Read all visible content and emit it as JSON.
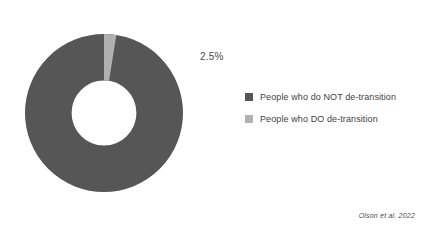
{
  "chart_data": {
    "type": "pie",
    "variant": "donut",
    "title": "",
    "xlabel": "",
    "ylabel": "",
    "grid": false,
    "legend_position": "right",
    "hole_ratio": 0.41,
    "start_angle_deg": 0,
    "direction": "clockwise",
    "units": "percent",
    "categories": [
      "People who do NOT de-transition",
      "People who DO de-transition"
    ],
    "values": [
      97.5,
      2.5
    ],
    "data_labels": [
      "97.5%",
      "2.5%"
    ],
    "colors": [
      "#565656",
      "#b0b0b0"
    ],
    "slices": [
      {
        "name": "People who do NOT de-transition",
        "value": 97.5,
        "label": "97.5%",
        "color": "#565656",
        "label_color": "#ffffff"
      },
      {
        "name": "People who DO de-transition",
        "value": 2.5,
        "label": "2.5%",
        "color": "#b0b0b0",
        "label_color": "#4a4a4a"
      }
    ],
    "annotations": [
      "Olson et al. 2022"
    ]
  },
  "legend": {
    "items": [
      {
        "label": "People who do NOT de-transition",
        "color": "#565656"
      },
      {
        "label": "People who DO de-transition",
        "color": "#b0b0b0"
      }
    ]
  },
  "source": {
    "text": "Olson et al. 2022"
  },
  "colors": {
    "background": "#ffffff",
    "major_slice": "#565656",
    "minor_slice": "#b0b0b0",
    "text": "#3f3f3f"
  }
}
